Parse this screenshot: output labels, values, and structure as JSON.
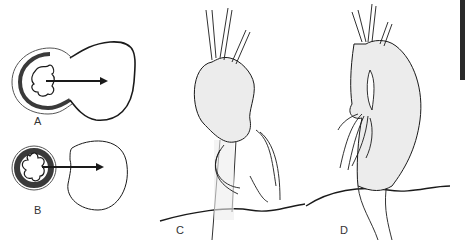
{
  "figure": {
    "panels": [
      {
        "id": "A",
        "label": "A",
        "description": "cross-section with star-shaped lumen and large balloon-like outpouching, arrow pointing right"
      },
      {
        "id": "B",
        "label": "B",
        "description": "cross-section with five-lobed lumen, separate round outpouching, arrow pointing right"
      },
      {
        "id": "C",
        "label": "C",
        "description": "lateral view of tubular organ with saccular dilation and branching nerves/vessels"
      },
      {
        "id": "D",
        "label": "D",
        "description": "lateral view of tubular organ with fusiform dilation and branching nerves/vessels"
      }
    ],
    "colors": {
      "stroke": "#1a1a1a",
      "fill_light": "#ececec",
      "wall_dark": "#3a3a3a",
      "edge_bar": "#2a2a2a"
    }
  }
}
